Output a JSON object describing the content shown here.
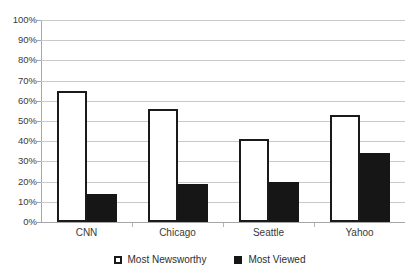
{
  "chart_data": {
    "type": "bar",
    "title": "",
    "subtitle": "",
    "xlabel": "",
    "ylabel": "",
    "ylim": [
      0,
      100
    ],
    "yticks": [
      "0%",
      "10%",
      "20%",
      "30%",
      "40%",
      "50%",
      "60%",
      "70%",
      "80%",
      "90%",
      "100%"
    ],
    "ytick_values": [
      0,
      10,
      20,
      30,
      40,
      50,
      60,
      70,
      80,
      90,
      100
    ],
    "grid": true,
    "legend_position": "bottom-center",
    "categories": [
      "CNN",
      "Chicago",
      "Seattle",
      "Yahoo"
    ],
    "series": [
      {
        "name": "Most Newsworthy",
        "color": "#ffffff",
        "edge_color": "#1a1a1a",
        "values": [
          65,
          56,
          41,
          53
        ]
      },
      {
        "name": "Most Viewed",
        "color": "#161616",
        "edge_color": "#161616",
        "values": [
          14,
          19,
          20,
          34
        ]
      }
    ]
  },
  "axis": {
    "line_color": "#a6a6a6",
    "grid_color": "#c9c9c9"
  },
  "legend": {
    "items": [
      {
        "label": "Most Newsworthy",
        "marker": "hollow-square-marker"
      },
      {
        "label": "Most Viewed",
        "marker": "filled-square-marker"
      }
    ]
  }
}
